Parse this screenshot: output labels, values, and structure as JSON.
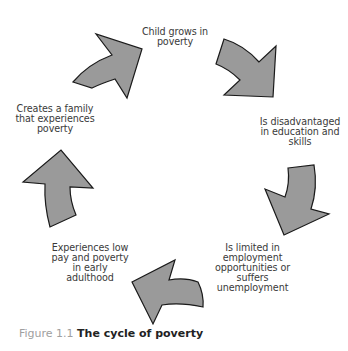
{
  "diagram": {
    "type": "cycle",
    "arrow_fill": "#9a9a9a",
    "arrow_stroke": "#1a1a1a",
    "stages": [
      {
        "id": "stage-1",
        "label": "Child grows in\npoverty"
      },
      {
        "id": "stage-2",
        "label": "Is disadvantaged\nin education and\nskills"
      },
      {
        "id": "stage-3",
        "label": "Is limited in\nemployment\nopportunities or\nsuffers\nunemployment"
      },
      {
        "id": "stage-4",
        "label": "Experiences low\npay and poverty\nin early\nadulthood"
      },
      {
        "id": "stage-5",
        "label": "Creates a family\nthat experiences\npoverty"
      }
    ]
  },
  "caption": {
    "number": "Figure 1.1",
    "title": "The cycle of poverty"
  }
}
